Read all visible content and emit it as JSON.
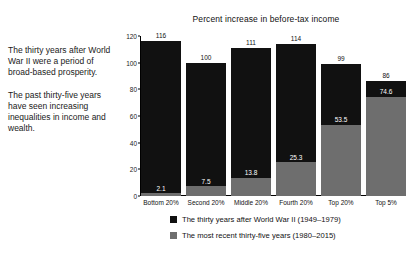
{
  "caption": {
    "paragraphs": [
      "The thirty years after World War II were a period of broad-based prosperity.",
      "The past thirty-five years have seen increasing inequalities in income and wealth."
    ]
  },
  "chart_data": {
    "type": "bar",
    "title": "Percent increase in before-tax income",
    "xlabel": "",
    "ylabel": "",
    "ylim": [
      0,
      120
    ],
    "yticks": [
      0,
      20,
      40,
      60,
      80,
      100,
      120
    ],
    "ytick_labels": [
      "0",
      "20",
      "40",
      "60",
      "80",
      "100",
      "120"
    ],
    "grid": false,
    "legend_position": "bottom",
    "bar_mode": "overlaid",
    "categories": [
      "Bottom 20%",
      "Second 20%",
      "Middle 20%",
      "Fourth 20%",
      "Top 20%",
      "Top 5%"
    ],
    "series": [
      {
        "name": "The thirty years after World War II (1949–1979)",
        "color": "#111111",
        "values": [
          116,
          100,
          111,
          114,
          99,
          86
        ],
        "value_labels": [
          "116",
          "100",
          "111",
          "114",
          "99",
          "86"
        ]
      },
      {
        "name": "The most recent thirty-five years (1980–2015)",
        "color": "#6e6e6e",
        "values": [
          2.1,
          7.5,
          13.8,
          25.3,
          53.5,
          74.6
        ],
        "value_labels": [
          "2.1",
          "7.5",
          "13.8",
          "25.3",
          "53.5",
          "74.6"
        ]
      }
    ]
  },
  "legend": {
    "items": [
      {
        "label": "The thirty years after World War II (1949–1979)",
        "color": "#111111"
      },
      {
        "label": "The most recent thirty-five years (1980–2015)",
        "color": "#6e6e6e"
      }
    ]
  }
}
